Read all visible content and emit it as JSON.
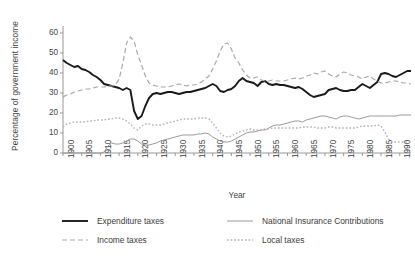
{
  "chart_data": {
    "type": "line",
    "title": "",
    "xlabel": "Year",
    "ylabel": "Percentage of government income",
    "xlim": [
      1900,
      1993
    ],
    "ylim": [
      0,
      65
    ],
    "yticks": [
      0,
      10,
      20,
      30,
      40,
      50,
      60
    ],
    "xticks": [
      1900,
      1905,
      1910,
      1915,
      1920,
      1925,
      1930,
      1935,
      1940,
      1945,
      1950,
      1955,
      1960,
      1965,
      1970,
      1975,
      1980,
      1985,
      1990
    ],
    "grid": false,
    "legend_position": "bottom",
    "x": [
      1900,
      1901,
      1902,
      1903,
      1904,
      1905,
      1906,
      1907,
      1908,
      1909,
      1910,
      1911,
      1912,
      1913,
      1914,
      1915,
      1916,
      1917,
      1918,
      1919,
      1920,
      1921,
      1922,
      1923,
      1924,
      1925,
      1926,
      1927,
      1928,
      1929,
      1930,
      1931,
      1932,
      1933,
      1934,
      1935,
      1936,
      1937,
      1938,
      1939,
      1940,
      1941,
      1942,
      1943,
      1944,
      1945,
      1946,
      1947,
      1948,
      1949,
      1950,
      1951,
      1952,
      1953,
      1954,
      1955,
      1956,
      1957,
      1958,
      1959,
      1960,
      1961,
      1962,
      1963,
      1964,
      1965,
      1966,
      1967,
      1968,
      1969,
      1970,
      1971,
      1972,
      1973,
      1974,
      1975,
      1976,
      1977,
      1978,
      1979,
      1980,
      1981,
      1982,
      1983,
      1984,
      1985,
      1986,
      1987,
      1988,
      1989,
      1990,
      1991,
      1992,
      1993
    ],
    "series": [
      {
        "name": "Expenditure taxes",
        "style": "solid",
        "color": "#1a1a1a",
        "width": 1.9,
        "values": [
          46.5,
          45.0,
          44.0,
          43.0,
          43.5,
          42.0,
          41.5,
          40.5,
          39.0,
          38.0,
          36.5,
          34.5,
          34.0,
          33.5,
          33.0,
          32.5,
          31.5,
          32.5,
          31.5,
          21.0,
          17.0,
          18.5,
          23.5,
          27.5,
          29.5,
          30.0,
          29.5,
          30.0,
          30.5,
          30.5,
          30.0,
          29.5,
          30.0,
          30.5,
          30.5,
          31.0,
          31.5,
          32.0,
          32.5,
          33.5,
          34.5,
          33.5,
          31.0,
          30.5,
          31.5,
          32.0,
          33.5,
          36.0,
          37.5,
          36.0,
          35.5,
          35.0,
          33.5,
          35.5,
          36.0,
          34.5,
          34.0,
          34.5,
          34.0,
          34.0,
          33.5,
          33.0,
          32.5,
          33.0,
          32.0,
          30.5,
          29.0,
          28.0,
          28.5,
          29.0,
          29.5,
          31.5,
          32.0,
          32.5,
          31.5,
          31.0,
          31.0,
          31.5,
          31.5,
          33.0,
          34.5,
          33.5,
          32.5,
          34.0,
          35.5,
          39.5,
          40.0,
          39.5,
          38.5,
          38.0,
          39.0,
          40.0,
          41.0,
          41.0
        ]
      },
      {
        "name": "Income taxes",
        "style": "dashed",
        "color": "#a8a8a8",
        "width": 1.2,
        "values": [
          28.0,
          29.0,
          29.5,
          30.5,
          31.0,
          31.5,
          32.0,
          32.0,
          32.5,
          33.0,
          33.0,
          33.0,
          33.5,
          33.5,
          34.0,
          37.0,
          45.0,
          55.0,
          58.0,
          56.0,
          49.0,
          44.0,
          38.5,
          35.0,
          34.0,
          33.5,
          33.0,
          33.0,
          33.0,
          33.5,
          34.0,
          34.5,
          34.0,
          33.5,
          34.0,
          34.0,
          34.5,
          35.5,
          37.0,
          38.5,
          42.0,
          46.0,
          51.0,
          54.5,
          55.0,
          52.0,
          47.5,
          45.0,
          41.5,
          39.0,
          37.5,
          37.5,
          38.0,
          36.5,
          36.0,
          36.0,
          36.5,
          36.0,
          36.0,
          36.0,
          36.5,
          37.0,
          37.5,
          37.0,
          37.5,
          38.5,
          39.0,
          40.0,
          39.5,
          40.5,
          41.0,
          39.5,
          38.5,
          38.0,
          39.5,
          40.5,
          40.0,
          39.0,
          38.5,
          38.0,
          37.0,
          38.0,
          38.5,
          37.0,
          36.0,
          35.0,
          35.0,
          35.5,
          36.0,
          36.0,
          35.5,
          35.0,
          35.0,
          34.5
        ]
      },
      {
        "name": "National Insurance Contributions",
        "style": "solid",
        "color": "#9a9a9a",
        "width": 1.0,
        "values": [
          0.0,
          0.0,
          0.0,
          0.0,
          0.0,
          0.0,
          0.0,
          0.0,
          0.0,
          0.0,
          0.0,
          0.5,
          3.5,
          5.0,
          4.5,
          4.5,
          5.0,
          6.0,
          7.0,
          7.0,
          6.0,
          4.5,
          4.0,
          4.0,
          4.5,
          5.0,
          6.0,
          6.5,
          7.0,
          7.5,
          8.0,
          8.5,
          9.0,
          9.0,
          9.0,
          9.0,
          9.5,
          9.5,
          10.0,
          9.5,
          8.0,
          7.0,
          6.0,
          5.5,
          5.5,
          6.0,
          7.0,
          8.0,
          9.0,
          10.0,
          10.5,
          10.5,
          11.0,
          11.5,
          11.5,
          12.5,
          13.5,
          14.0,
          14.0,
          14.5,
          15.0,
          15.5,
          16.0,
          16.0,
          15.5,
          16.5,
          17.0,
          17.5,
          18.0,
          18.5,
          18.5,
          18.0,
          17.5,
          17.0,
          18.0,
          18.5,
          18.5,
          18.0,
          17.5,
          17.0,
          17.5,
          18.0,
          18.5,
          18.5,
          18.5,
          18.5,
          18.5,
          18.5,
          18.5,
          18.5,
          19.0,
          19.0,
          19.0,
          19.0
        ]
      },
      {
        "name": "Local taxes",
        "style": "dotted",
        "color": "#b0b0b0",
        "width": 1.3,
        "values": [
          13.0,
          14.5,
          15.0,
          15.5,
          15.5,
          15.5,
          15.5,
          16.0,
          16.0,
          16.5,
          16.5,
          16.5,
          17.0,
          17.0,
          17.5,
          17.5,
          17.0,
          16.0,
          14.5,
          12.5,
          11.5,
          13.5,
          14.5,
          14.5,
          14.0,
          14.0,
          14.0,
          14.5,
          15.0,
          15.5,
          16.0,
          16.5,
          17.0,
          17.0,
          17.0,
          17.0,
          17.5,
          17.5,
          17.5,
          17.0,
          15.0,
          12.5,
          10.0,
          8.5,
          8.0,
          8.5,
          9.5,
          10.5,
          11.0,
          11.5,
          12.0,
          11.5,
          11.5,
          11.5,
          12.0,
          12.0,
          12.5,
          12.5,
          12.5,
          12.5,
          12.5,
          12.5,
          12.5,
          12.5,
          13.0,
          13.0,
          13.0,
          13.0,
          12.5,
          12.5,
          12.5,
          13.0,
          13.0,
          12.5,
          12.5,
          12.5,
          12.5,
          12.5,
          12.5,
          13.0,
          13.5,
          13.5,
          13.5,
          13.5,
          14.0,
          13.5,
          10.5,
          7.0,
          5.5,
          5.5,
          5.5,
          5.5,
          5.5,
          5.5
        ]
      }
    ]
  },
  "legend": {
    "items": [
      {
        "label": "Expenditure taxes"
      },
      {
        "label": "Income taxes"
      },
      {
        "label": "National Insurance Contributions"
      },
      {
        "label": "Local taxes"
      }
    ]
  }
}
